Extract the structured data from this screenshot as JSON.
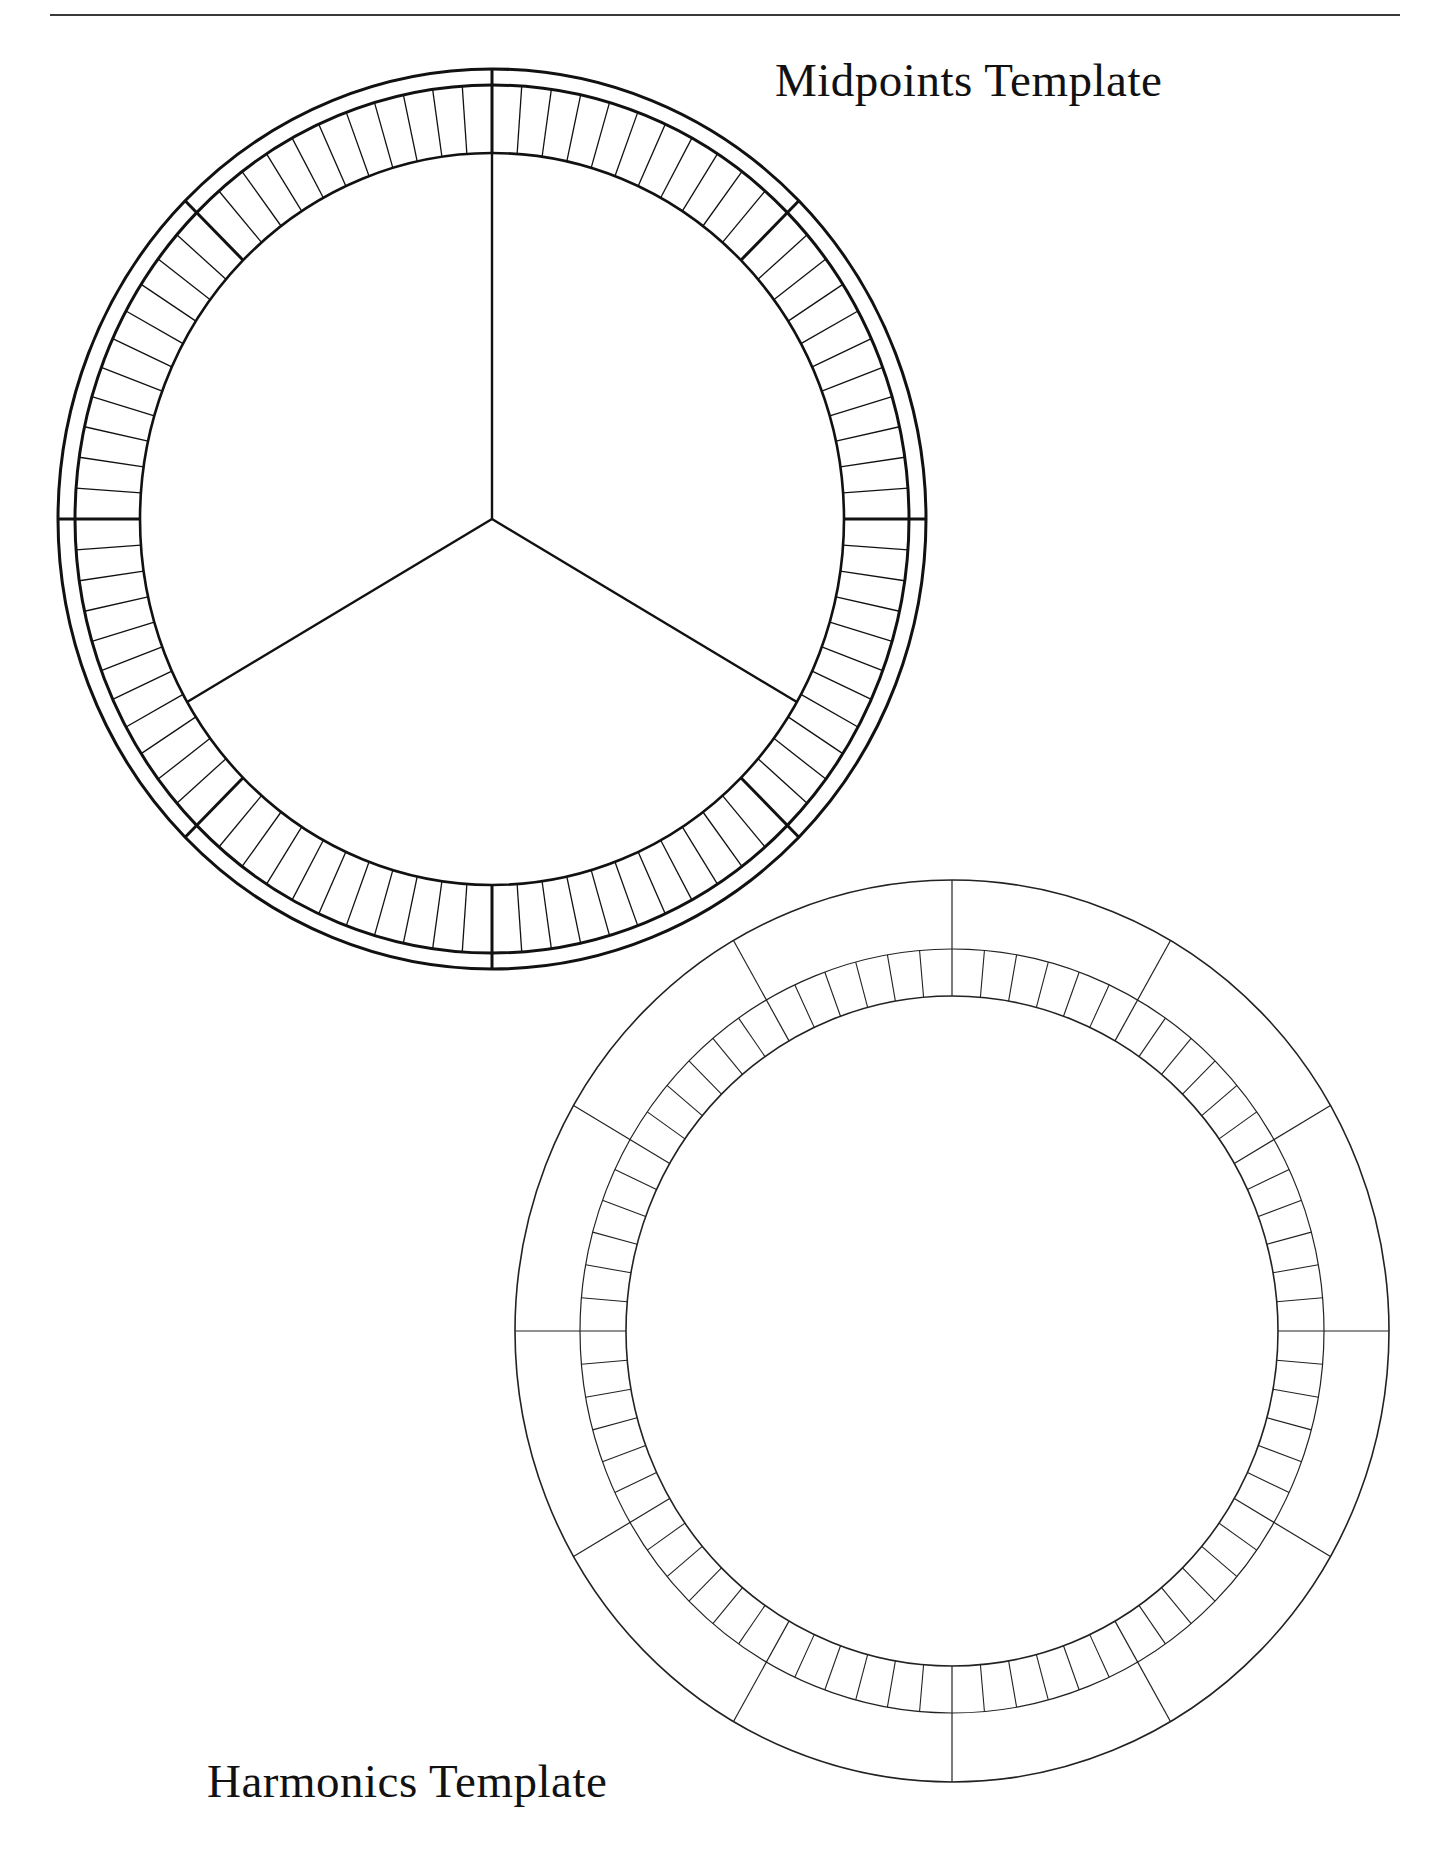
{
  "page": {
    "background": "#ffffff",
    "ink_color": "#111111",
    "rule_color": "#3a3a3a"
  },
  "midpoints": {
    "title": "Midpoints Template",
    "center": [
      492,
      519
    ],
    "radii": {
      "outer": [
        434,
        450
      ],
      "ring_outer": [
        417,
        434
      ],
      "ring_inner": [
        352,
        366
      ]
    },
    "major_divisions": 8,
    "minor_per_major": 11,
    "spokes_deg": [
      0,
      120,
      240
    ],
    "stroke_color": "#111111"
  },
  "harmonics": {
    "title": "Harmonics Template",
    "center": [
      952,
      1331
    ],
    "radii": {
      "outer": [
        437,
        451
      ],
      "ring_outer": [
        372,
        382
      ],
      "ring_inner": [
        326,
        335
      ]
    },
    "spoke_count": 12,
    "minor_per_spoke": 6,
    "stroke_color": "#222222"
  }
}
